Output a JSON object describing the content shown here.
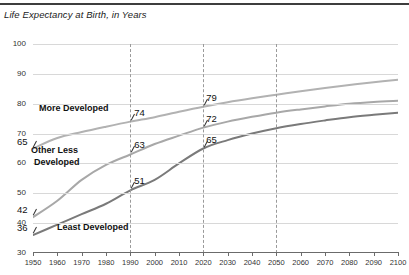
{
  "chart_data": {
    "type": "line",
    "title": "Life Expectancy at Birth, in Years",
    "xlabel": "",
    "ylabel": "",
    "xlim": [
      1950,
      2100
    ],
    "ylim": [
      30,
      100
    ],
    "ytick_step": 10,
    "yticks": [
      30,
      40,
      50,
      60,
      70,
      80,
      90,
      100
    ],
    "xticks": [
      1950,
      1960,
      1970,
      1980,
      1990,
      2000,
      2010,
      2020,
      2030,
      2040,
      2050,
      2060,
      2070,
      2080,
      2090,
      2100
    ],
    "grid": "horizontal",
    "legend": "inline-labels",
    "reference_lines": [
      1990,
      2020,
      2050
    ],
    "x": [
      1950,
      1960,
      1970,
      1980,
      1990,
      2000,
      2010,
      2020,
      2030,
      2040,
      2050,
      2060,
      2070,
      2080,
      2090,
      2100
    ],
    "series": [
      {
        "name": "More Developed",
        "color": "#b2b2b2",
        "values": [
          65,
          68.5,
          70.5,
          72.3,
          74,
          75.5,
          77.3,
          79,
          80.5,
          81.8,
          83,
          84.2,
          85.3,
          86.3,
          87.2,
          88
        ]
      },
      {
        "name": "Other Less Developed",
        "color": "#a8a8a8",
        "values": [
          42,
          47.5,
          54.5,
          59.5,
          63,
          66.5,
          69.3,
          72,
          74,
          75.6,
          77,
          78.1,
          79.1,
          80,
          80.6,
          81
        ]
      },
      {
        "name": "Least Developed",
        "color": "#7a7a7a",
        "values": [
          36,
          39.5,
          43,
          46.5,
          51,
          54.5,
          60,
          65,
          67.8,
          70,
          71.8,
          73.2,
          74.4,
          75.5,
          76.3,
          77
        ]
      }
    ],
    "annotations": [
      {
        "series": "More Developed",
        "year": 1950,
        "value": 65,
        "text": "65"
      },
      {
        "series": "Other Less Developed",
        "year": 1950,
        "value": 42,
        "text": "42"
      },
      {
        "series": "Least Developed",
        "year": 1950,
        "value": 36,
        "text": "36"
      },
      {
        "series": "More Developed",
        "year": 1990,
        "value": 74,
        "text": "74"
      },
      {
        "series": "Other Less Developed",
        "year": 1990,
        "value": 63,
        "text": "63"
      },
      {
        "series": "Least Developed",
        "year": 1990,
        "value": 51,
        "text": "51"
      },
      {
        "series": "More Developed",
        "year": 2020,
        "value": 79,
        "text": "79"
      },
      {
        "series": "Other Less Developed",
        "year": 2020,
        "value": 72,
        "text": "72"
      },
      {
        "series": "Least Developed",
        "year": 2020,
        "value": 65,
        "text": "65"
      }
    ]
  },
  "labels": {
    "more_developed": "More  Developed",
    "other_less_developed_l1": "Other Less",
    "other_less_developed_l2": "Developed",
    "least_developed": "Least Developed"
  }
}
